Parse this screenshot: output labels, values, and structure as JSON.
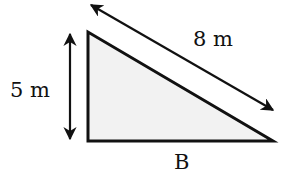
{
  "diagram": {
    "type": "right-triangle",
    "labels": {
      "height": "5 m",
      "hypotenuse": "8 m",
      "base": "B"
    },
    "colors": {
      "stroke": "#111111",
      "fill": "#f2f2f2"
    },
    "shapes": {
      "triangle": {
        "vertices": [
          [
            88,
            32
          ],
          [
            88,
            141
          ],
          [
            273,
            141
          ]
        ]
      },
      "height_arrow": {
        "from": [
          70,
          32
        ],
        "to": [
          70,
          141
        ],
        "double_headed": true
      },
      "hypotenuse_arrow": {
        "from": [
          89,
          4
        ],
        "to": [
          275,
          111
        ],
        "double_headed": true
      }
    }
  }
}
